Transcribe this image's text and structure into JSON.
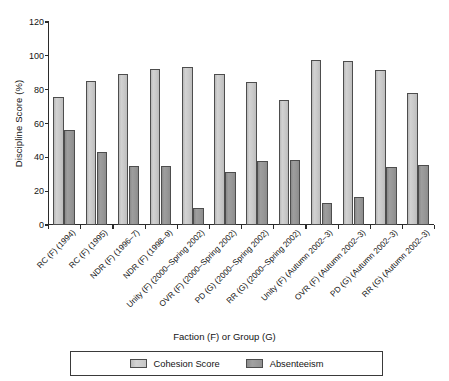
{
  "chart_data": {
    "type": "bar",
    "title": "",
    "xlabel": "Faction (F) or Group (G)",
    "ylabel": "Discipline Score (%)",
    "ylim": [
      0,
      120
    ],
    "yticks": [
      0,
      20,
      40,
      60,
      80,
      100,
      120
    ],
    "grid": false,
    "legend_position": "bottom",
    "categories": [
      "RC (F) (1994)",
      "RC (F) (1995)",
      "NDR (F) (1996–7)",
      "NDR (F) (1998–9)",
      "Unity (F) (2000–Spring 2002)",
      "OVR (F) (2000–Spring 2002)",
      "PD (G) (2000–Spring 2002)",
      "RR (G) (2000–Spring 2002)",
      "Unity (F) (Autumn 2002–3)",
      "OVR (F) (Autumn 2002–3)",
      "PD (G) (Autumn 2002–3)",
      "RR (G) (Autumn 2002–3)"
    ],
    "series": [
      {
        "name": "Cohesion Score",
        "color": "#c9c9c9",
        "values": [
          75.5,
          85.3,
          89.1,
          92.3,
          93.4,
          89.1,
          84.8,
          74.1,
          97.8,
          97.0,
          91.6,
          77.8
        ]
      },
      {
        "name": "Absenteeism",
        "color": "#979797",
        "values": [
          56.0,
          43.2,
          34.7,
          34.7,
          10.3,
          31.3,
          37.7,
          38.2,
          13.3,
          16.6,
          34.1,
          35.4
        ]
      }
    ]
  },
  "legend": {
    "items": [
      {
        "label": "Cohesion Score"
      },
      {
        "label": "Absenteeism"
      }
    ]
  }
}
